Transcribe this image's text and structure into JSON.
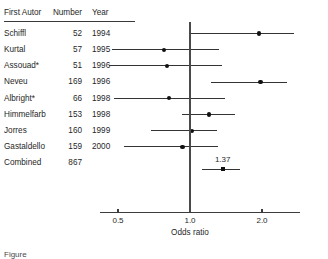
{
  "figure": {
    "caption_partial": "Figure",
    "axis_title": "Odds ratio",
    "summary_label": "1.37"
  },
  "table": {
    "headers": {
      "author": "First Autor",
      "number": "Number",
      "year": "Year"
    },
    "rows": [
      {
        "author": "Schiffl",
        "number": "52",
        "year": "1994"
      },
      {
        "author": "Kurtal",
        "number": "57",
        "year": "1995"
      },
      {
        "author": "Assouad*",
        "number": "51",
        "year": "1996"
      },
      {
        "author": "Neveu",
        "number": "169",
        "year": "1996"
      },
      {
        "author": "Albright*",
        "number": "66",
        "year": "1998"
      },
      {
        "author": "Himmelfarb",
        "number": "153",
        "year": "1998"
      },
      {
        "author": "Jorres",
        "number": "160",
        "year": "1999"
      },
      {
        "author": "Gastaldello",
        "number": "159",
        "year": "2000"
      },
      {
        "author": "Combined",
        "number": "867",
        "year": ""
      }
    ]
  },
  "chart_data": {
    "type": "forest",
    "title": "",
    "xlabel": "Odds ratio",
    "ylabel": "",
    "scale": "log",
    "xlim": [
      0.42,
      2.75
    ],
    "ticks": [
      0.5,
      1.0,
      2.0
    ],
    "tick_labels": [
      "0.5",
      "1.0",
      "2.0"
    ],
    "grid": false,
    "null_value": 1.0,
    "legend": "none",
    "studies": [
      {
        "label": "Schiffl",
        "n": 52,
        "year": 1994,
        "or": 1.95,
        "ci_low": 1.0,
        "ci_high": 2.72
      },
      {
        "label": "Kurtal",
        "n": 57,
        "year": 1995,
        "or": 0.78,
        "ci_low": 0.47,
        "ci_high": 1.32
      },
      {
        "label": "Assouad*",
        "n": 51,
        "year": 1996,
        "or": 0.8,
        "ci_low": 0.46,
        "ci_high": 1.36
      },
      {
        "label": "Neveu",
        "n": 169,
        "year": 1996,
        "or": 1.97,
        "ci_low": 1.22,
        "ci_high": 2.55
      },
      {
        "label": "Albright*",
        "n": 66,
        "year": 1998,
        "or": 0.82,
        "ci_low": 0.48,
        "ci_high": 1.4
      },
      {
        "label": "Himmelfarb",
        "n": 153,
        "year": 1998,
        "or": 1.2,
        "ci_low": 0.93,
        "ci_high": 1.54
      },
      {
        "label": "Jorres",
        "n": 160,
        "year": 1999,
        "or": 1.02,
        "ci_low": 0.69,
        "ci_high": 1.3
      },
      {
        "label": "Gastaldello",
        "n": 159,
        "year": 2000,
        "or": 0.93,
        "ci_low": 0.53,
        "ci_high": 1.31
      }
    ],
    "combined": {
      "label": "Combined",
      "n": 867,
      "or": 1.37,
      "ci_low": 1.12,
      "ci_high": 1.62,
      "value_label": "1.37"
    }
  }
}
